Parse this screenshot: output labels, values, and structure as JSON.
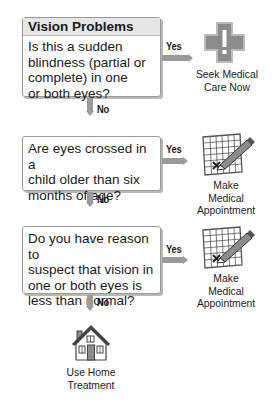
{
  "title": "Vision Problems",
  "colors": {
    "arrow": "#9a9a9a",
    "header_bg": "#e6e6e6",
    "icon_fill": "#8c8c8c"
  },
  "questions": [
    {
      "text_lines": [
        "Is this a sudden",
        "blindness (partial or",
        "complete) in one",
        "or both eyes?"
      ],
      "yes_label": "Yes",
      "no_label": "No",
      "yes_outcome": {
        "icon": "medical-cross-icon",
        "lines": [
          "Seek Medical",
          "Care Now"
        ]
      }
    },
    {
      "text_lines": [
        "Are eyes crossed in a",
        "child older than six",
        "months of age?"
      ],
      "yes_label": "Yes",
      "no_label": "No",
      "yes_outcome": {
        "icon": "calendar-pencil-icon",
        "lines": [
          "Make Medical",
          "Appointment"
        ]
      }
    },
    {
      "text_lines": [
        "Do you have reason to",
        "suspect that vision in",
        "one or both eyes is",
        "less than normal?"
      ],
      "yes_label": "Yes",
      "no_label": "No",
      "yes_outcome": {
        "icon": "calendar-pencil-icon",
        "lines": [
          "Make Medical",
          "Appointment"
        ]
      }
    }
  ],
  "final_outcome": {
    "icon": "house-icon",
    "lines": [
      "Use Home",
      "Treatment"
    ]
  }
}
